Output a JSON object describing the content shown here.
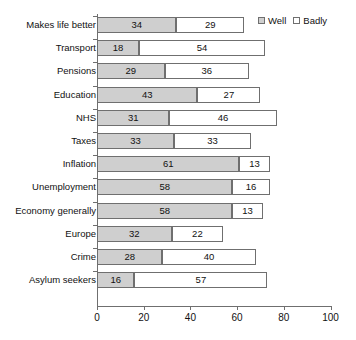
{
  "legend": {
    "position": "top-right",
    "items": [
      {
        "label": "Well",
        "color": "#cfcfcf",
        "icon": "square-filled-icon"
      },
      {
        "label": "Badly",
        "color": "#ffffff",
        "icon": "square-outline-icon"
      }
    ]
  },
  "axis": {
    "x_ticks": [
      "0",
      "20",
      "40",
      "60",
      "80",
      "100"
    ],
    "x_tick_values": [
      0,
      20,
      40,
      60,
      80,
      100
    ]
  },
  "chart_data": {
    "type": "bar",
    "orientation": "horizontal",
    "stacked": true,
    "title": "",
    "subtitle": "",
    "xlabel": "",
    "ylabel": "",
    "xlim": [
      0,
      100
    ],
    "grid": false,
    "legend_position": "top-right",
    "categories": [
      "Makes life better",
      "Transport",
      "Pensions",
      "Education",
      "NHS",
      "Taxes",
      "Inflation",
      "Unemployment",
      "Economy generally",
      "Europe",
      "Crime",
      "Asylum seekers"
    ],
    "series": [
      {
        "name": "Well",
        "color": "#cfcfcf",
        "values": [
          34,
          18,
          29,
          43,
          31,
          33,
          61,
          58,
          58,
          32,
          28,
          16
        ]
      },
      {
        "name": "Badly",
        "color": "#ffffff",
        "values": [
          29,
          54,
          36,
          27,
          46,
          33,
          13,
          16,
          13,
          22,
          40,
          57
        ]
      }
    ],
    "data_labels": [
      {
        "category": "Makes life better",
        "well": 34,
        "badly": 29
      },
      {
        "category": "Transport",
        "well": 18,
        "badly": 54
      },
      {
        "category": "Pensions",
        "well": 29,
        "badly": 36
      },
      {
        "category": "Education",
        "well": 43,
        "badly": 27
      },
      {
        "category": "NHS",
        "well": 31,
        "badly": 46
      },
      {
        "category": "Taxes",
        "well": 33,
        "badly": 33
      },
      {
        "category": "Inflation",
        "well": 61,
        "badly": 13
      },
      {
        "category": "Unemployment",
        "well": 58,
        "badly": 16
      },
      {
        "category": "Economy generally",
        "well": 58,
        "badly": 13
      },
      {
        "category": "Europe",
        "well": 32,
        "badly": 22
      },
      {
        "category": "Crime",
        "well": 28,
        "badly": 40
      },
      {
        "category": "Asylum seekers",
        "well": 16,
        "badly": 57
      }
    ]
  }
}
